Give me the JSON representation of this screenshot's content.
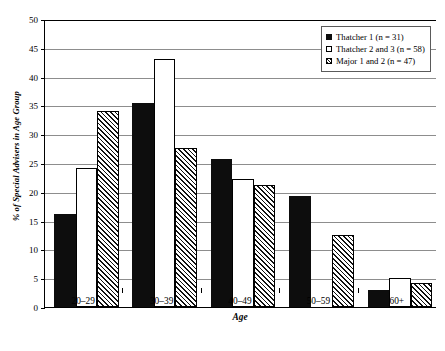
{
  "chart_data": {
    "type": "bar",
    "title": "",
    "xlabel": "Age",
    "ylabel": "% of Special Advisers in Age Group",
    "categories": [
      "20–29",
      "30–39",
      "40–49",
      "50–59",
      "60+"
    ],
    "ylim": [
      0,
      50
    ],
    "yticks": [
      0,
      5,
      10,
      15,
      20,
      25,
      30,
      35,
      40,
      45,
      50
    ],
    "ytick_labels": [
      "0",
      "5",
      "10",
      "15",
      "20",
      "25",
      "30",
      "35",
      "40",
      "45",
      "50"
    ],
    "grid": true,
    "legend_position": "top-right",
    "series": [
      {
        "name": "Thatcher 1 (n = 31)",
        "style": "solid",
        "values": [
          16.1,
          35.5,
          25.7,
          19.3,
          2.9
        ]
      },
      {
        "name": "Thatcher 2 and 3 (n = 58)",
        "style": "open",
        "values": [
          24.2,
          43.0,
          22.3,
          0,
          5.0
        ]
      },
      {
        "name": "Major 1 and 2 (n = 47)",
        "style": "hatch",
        "values": [
          34.0,
          27.6,
          21.1,
          12.5,
          4.1
        ]
      }
    ]
  },
  "axis": {
    "y_title": "% of Special Advisers in Age Group",
    "x_title": "Age"
  },
  "colors": {
    "solid": "#0d0d0d",
    "open": "#ffffff",
    "hatch": "#111111",
    "gridline": "#8d8d8d",
    "axis": "#000000",
    "background": "#ffffff"
  }
}
